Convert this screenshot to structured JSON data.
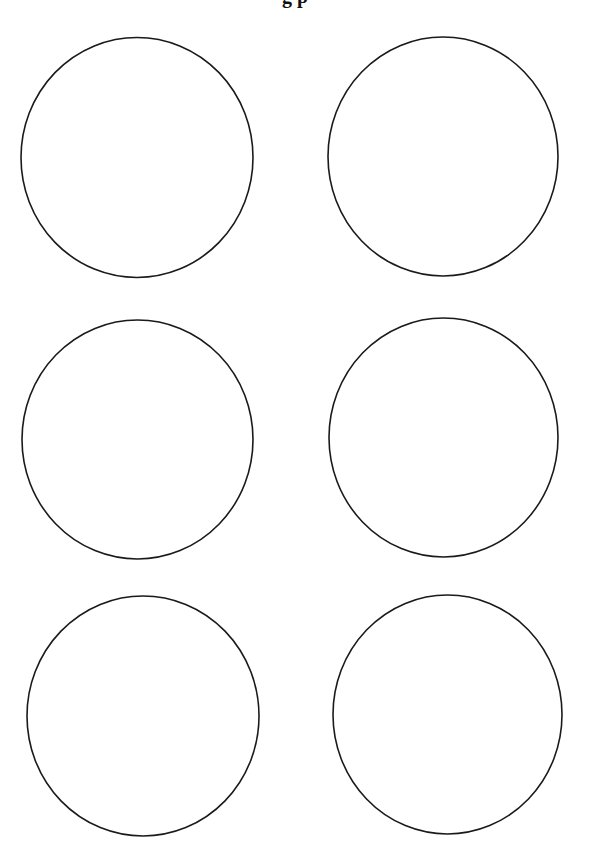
{
  "page": {
    "title_partial": "g                                        p",
    "background": "#ffffff",
    "stroke_color": "#1a1a1a",
    "stroke_width": 1.6
  },
  "circles": [
    {
      "id": "circle-1",
      "cx": 137,
      "cy": 157.5,
      "rx": 116,
      "ry": 120
    },
    {
      "id": "circle-2",
      "cx": 443,
      "cy": 156.5,
      "rx": 115,
      "ry": 119.5
    },
    {
      "id": "circle-3",
      "cx": 137.5,
      "cy": 439.5,
      "rx": 115.5,
      "ry": 119.5
    },
    {
      "id": "circle-4",
      "cx": 443.5,
      "cy": 437.5,
      "rx": 114.5,
      "ry": 119.5
    },
    {
      "id": "circle-5",
      "cx": 143,
      "cy": 716,
      "rx": 116,
      "ry": 120
    },
    {
      "id": "circle-6",
      "cx": 447.5,
      "cy": 714.5,
      "rx": 114.5,
      "ry": 119.5
    }
  ]
}
